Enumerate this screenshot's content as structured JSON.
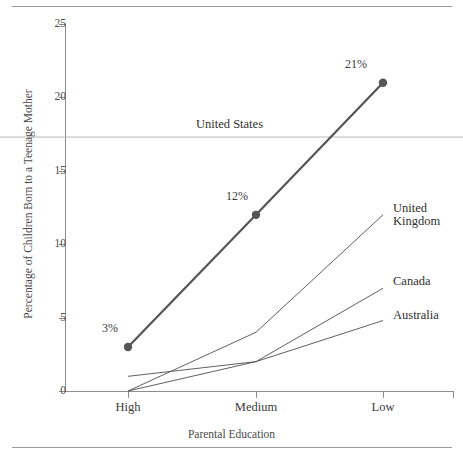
{
  "figure": {
    "name": "teenage-mother-by-parental-education-chart",
    "top_rule": true,
    "bottom_rule": true
  },
  "chart_data": {
    "type": "line",
    "title": "",
    "xlabel": "Parental Education",
    "ylabel": "Percentage of Children Born to a Teenage Mother",
    "categories": [
      "High",
      "Medium",
      "Low"
    ],
    "ylim": [
      0,
      25
    ],
    "yticks": [
      0,
      5,
      10,
      15,
      20,
      25
    ],
    "ytick_labels": [
      "0",
      "5",
      "10",
      "15",
      "20",
      "25"
    ],
    "grid": false,
    "legend_position": "inline-end-of-line",
    "series": [
      {
        "name": "United States",
        "values": [
          3,
          12,
          21
        ],
        "color": "#555555",
        "width": 2.2,
        "markers": true,
        "point_labels": [
          "3%",
          "12%",
          "21%"
        ]
      },
      {
        "name": "United Kingdom",
        "label_lines": "United\nKingdom",
        "values": [
          0,
          4,
          12
        ],
        "color": "#4d4d4d",
        "width": 0.9,
        "markers": false
      },
      {
        "name": "Canada",
        "label_lines": "Canada",
        "values": [
          0,
          2,
          7
        ],
        "color": "#4d4d4d",
        "width": 0.9,
        "markers": false
      },
      {
        "name": "Australia",
        "label_lines": "Australia",
        "values": [
          1,
          2,
          4.8
        ],
        "color": "#4d4d4d",
        "width": 0.9,
        "markers": false
      }
    ],
    "reference_lines": [
      {
        "name": "United States",
        "label": "United States",
        "value": 17.3,
        "color": "#b9b9b9",
        "orientation": "horizontal",
        "spans_full_width": true
      }
    ],
    "annotations": [
      {
        "text": "3%",
        "series": "United States",
        "category": "High"
      },
      {
        "text": "12%",
        "series": "United States",
        "category": "Medium"
      },
      {
        "text": "21%",
        "series": "United States",
        "category": "Low"
      }
    ]
  }
}
